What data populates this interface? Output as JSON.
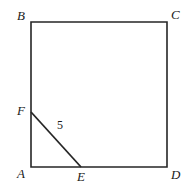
{
  "figure": {
    "background_color": "#ffffff",
    "stroke_color": "#262626",
    "stroke_width": 1.6,
    "labels": {
      "B": "B",
      "C": "C",
      "A": "A",
      "D": "D",
      "F": "F",
      "E": "E",
      "segment_length": "5"
    }
  },
  "chart_data": {
    "type": "diagram",
    "shapes": [
      {
        "name": "square-ABCD",
        "kind": "polygon",
        "vertices": [
          {
            "label": "B",
            "x": 31,
            "y": 22
          },
          {
            "label": "C",
            "x": 167,
            "y": 22
          },
          {
            "label": "D",
            "x": 167,
            "y": 167
          },
          {
            "label": "A",
            "x": 31,
            "y": 167
          }
        ],
        "closed": true,
        "fill": "none",
        "stroke": "#262626"
      },
      {
        "name": "segment-FE",
        "kind": "line",
        "from": {
          "label": "F",
          "x": 31,
          "y": 112
        },
        "to": {
          "label": "E",
          "x": 81,
          "y": 167
        },
        "length_label": "5",
        "stroke": "#262626"
      }
    ],
    "points": [
      {
        "label": "B",
        "x": 31,
        "y": 22,
        "label_pos": "upper-left"
      },
      {
        "label": "C",
        "x": 167,
        "y": 22,
        "label_pos": "upper-right"
      },
      {
        "label": "A",
        "x": 31,
        "y": 167,
        "label_pos": "lower-left"
      },
      {
        "label": "D",
        "x": 167,
        "y": 167,
        "label_pos": "lower-right"
      },
      {
        "label": "F",
        "x": 31,
        "y": 112,
        "label_pos": "left"
      },
      {
        "label": "E",
        "x": 81,
        "y": 167,
        "label_pos": "below"
      }
    ],
    "annotations": [
      {
        "text": "5",
        "x": 61,
        "y": 125,
        "refers_to": "segment-FE"
      }
    ],
    "xlabel": "",
    "ylabel": "",
    "grid": false,
    "legend": "none"
  }
}
